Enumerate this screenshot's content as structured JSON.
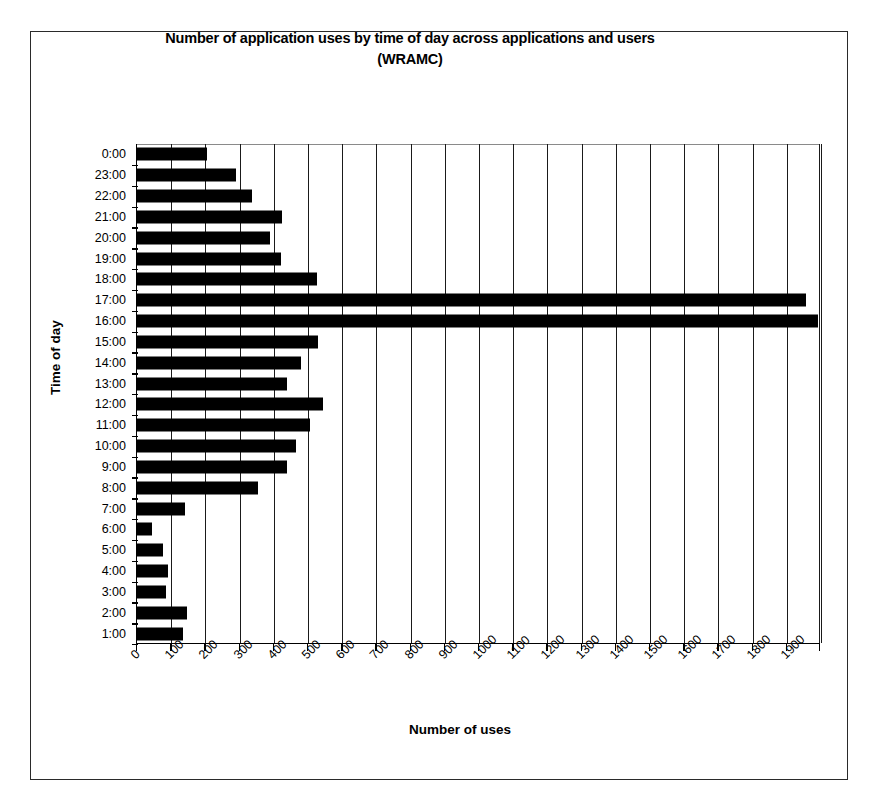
{
  "chart_data": {
    "type": "bar",
    "orientation": "horizontal",
    "title": "Number of application uses by time of day across applications and users (WRAMC)",
    "title_line1": "Number of application uses by time of day across applications and users",
    "title_line2": "(WRAMC)",
    "xlabel": "Number of uses",
    "ylabel": "Time of day",
    "xlim": [
      0,
      2000
    ],
    "ylim_categories_order": "top-to-bottom",
    "grid": true,
    "legend": false,
    "xticks": [
      0,
      100,
      200,
      300,
      400,
      500,
      600,
      700,
      800,
      900,
      1000,
      1100,
      1200,
      1300,
      1400,
      1500,
      1600,
      1700,
      1800,
      1900
    ],
    "xtick_labels": [
      "0",
      "100",
      "200",
      "300",
      "400",
      "500",
      "600",
      "700",
      "800",
      "900",
      "1000",
      "1100",
      "1200",
      "1300",
      "1400",
      "1500",
      "1600",
      "1700",
      "1800",
      "1900"
    ],
    "categories": [
      "0:00",
      "23:00",
      "22:00",
      "21:00",
      "20:00",
      "19:00",
      "18:00",
      "17:00",
      "16:00",
      "15:00",
      "14:00",
      "13:00",
      "12:00",
      "11:00",
      "10:00",
      "9:00",
      "8:00",
      "7:00",
      "6:00",
      "5:00",
      "4:00",
      "3:00",
      "2:00",
      "1:00"
    ],
    "values": [
      205,
      290,
      335,
      425,
      390,
      420,
      525,
      1955,
      1990,
      530,
      480,
      440,
      545,
      505,
      465,
      440,
      355,
      140,
      45,
      75,
      90,
      85,
      145,
      135
    ],
    "series": [
      {
        "name": "Number of uses",
        "color": "#000000",
        "values": [
          205,
          290,
          335,
          425,
          390,
          420,
          525,
          1955,
          1990,
          530,
          480,
          440,
          545,
          505,
          465,
          440,
          355,
          140,
          45,
          75,
          90,
          85,
          145,
          135
        ]
      }
    ]
  }
}
